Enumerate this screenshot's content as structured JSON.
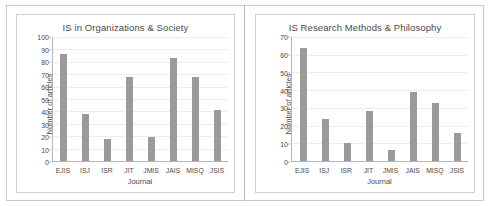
{
  "figure": {
    "background_color": "#ffffff",
    "frame_color": "#c9c9c9",
    "bar_color": "#9a9a9a"
  },
  "chart_data": [
    {
      "type": "bar",
      "title": "IS in Organizations & Society",
      "xlabel": "Journal",
      "ylabel": "Number of articles",
      "categories": [
        "EJIS",
        "ISJ",
        "ISR",
        "JIT",
        "JMIS",
        "JAIS",
        "MISQ",
        "JSIS"
      ],
      "values": [
        86,
        38,
        18,
        68,
        19,
        83,
        68,
        41
      ],
      "yticks": [
        0,
        10,
        20,
        30,
        40,
        50,
        60,
        70,
        80,
        90,
        100
      ],
      "ylim": [
        0,
        100
      ],
      "grid": true,
      "legend": false
    },
    {
      "type": "bar",
      "title": "IS Research Methods & Philosophy",
      "xlabel": "Journal",
      "ylabel": "Number of articles",
      "categories": [
        "EJIS",
        "ISJ",
        "ISR",
        "JIT",
        "JMIS",
        "JAIS",
        "MISQ",
        "JSIS"
      ],
      "values": [
        64,
        24,
        10,
        28,
        6,
        39,
        33,
        16
      ],
      "yticks": [
        0,
        10,
        20,
        30,
        40,
        50,
        60,
        70
      ],
      "ylim": [
        0,
        70
      ],
      "grid": true,
      "legend": false
    }
  ]
}
